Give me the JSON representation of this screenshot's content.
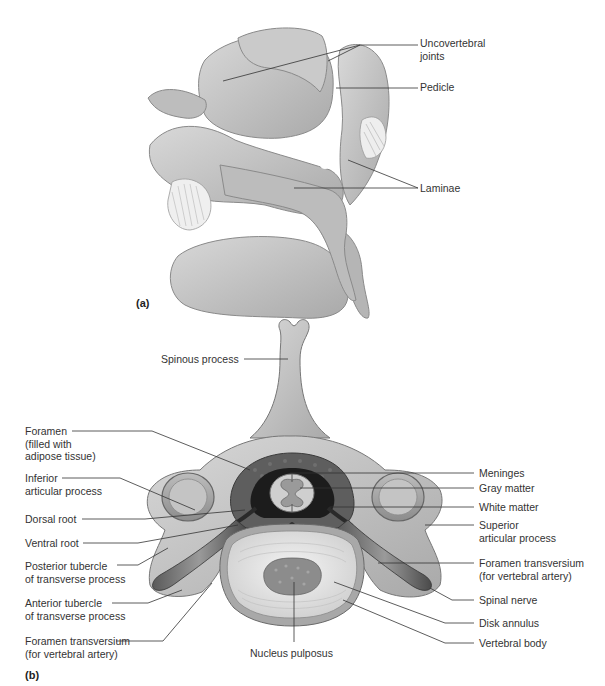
{
  "figure": {
    "panel_a": {
      "tag": "(a)",
      "labels": [
        {
          "id": "uncovertebral-joints",
          "text": "Uncovertebral\njoints"
        },
        {
          "id": "pedicle",
          "text": "Pedicle"
        },
        {
          "id": "laminae",
          "text": "Laminae"
        }
      ]
    },
    "panel_b": {
      "tag": "(b)",
      "labels_left": [
        {
          "id": "foramen-adipose",
          "text": "Foramen\n(filled with\nadipose tissue)"
        },
        {
          "id": "inferior-articular-process",
          "text": "Inferior\narticular process"
        },
        {
          "id": "dorsal-root",
          "text": "Dorsal root"
        },
        {
          "id": "ventral-root",
          "text": "Ventral root"
        },
        {
          "id": "posterior-tubercle",
          "text": "Posterior tubercle\nof transverse process"
        },
        {
          "id": "anterior-tubercle",
          "text": "Anterior tubercle\nof transverse process"
        },
        {
          "id": "foramen-transversium-left",
          "text": "Foramen transversium\n(for vertebral artery)"
        }
      ],
      "labels_right": [
        {
          "id": "meninges",
          "text": "Meninges"
        },
        {
          "id": "gray-matter",
          "text": "Gray matter"
        },
        {
          "id": "white-matter",
          "text": "White matter"
        },
        {
          "id": "superior-articular-process",
          "text": "Superior\narticular process"
        },
        {
          "id": "foramen-transversium-right",
          "text": "Foramen transversium\n(for vertebral artery)"
        },
        {
          "id": "spinal-nerve",
          "text": "Spinal nerve"
        },
        {
          "id": "disk-annulus",
          "text": "Disk annulus"
        },
        {
          "id": "vertebral-body",
          "text": "Vertebral body"
        }
      ],
      "labels_top": [
        {
          "id": "spinous-process",
          "text": "Spinous process"
        }
      ],
      "labels_bottom": [
        {
          "id": "nucleus-pulposus",
          "text": "Nucleus pulposus"
        }
      ]
    }
  }
}
